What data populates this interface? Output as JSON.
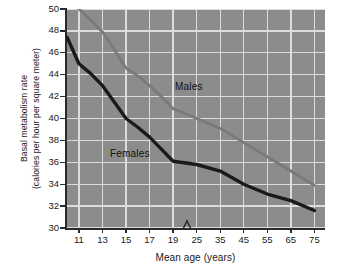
{
  "chart_data": {
    "type": "line",
    "title": "",
    "xlabel": "Mean age (years)",
    "ylabel_line1": "Basal metabolism rate",
    "ylabel_line2": "(calories per hour per square meter)",
    "x_tick_labels": [
      "11",
      "13",
      "15",
      "17",
      "19",
      "25",
      "35",
      "45",
      "55",
      "65",
      "75"
    ],
    "y_tick_labels": [
      "30",
      "32",
      "34",
      "36",
      "38",
      "40",
      "42",
      "44",
      "46",
      "48",
      "50"
    ],
    "ylim": [
      30,
      50
    ],
    "grid": true,
    "legend_position": "inline-annotation",
    "axis_break": {
      "between": [
        "19",
        "25"
      ],
      "symbol": "zigzag"
    },
    "plot_background": "#8c8c8c",
    "grid_color": "#dcdcdc",
    "series": [
      {
        "name": "Males",
        "color": "#7a7a7a",
        "label": "Males",
        "x": [
          "11",
          "12",
          "13",
          "14",
          "15",
          "16",
          "17",
          "18",
          "19",
          "25",
          "35",
          "45",
          "55",
          "65",
          "75"
        ],
        "values": [
          50.0,
          49.0,
          47.9,
          46.3,
          44.6,
          43.9,
          43.0,
          42.0,
          40.9,
          40.0,
          39.1,
          37.8,
          36.5,
          35.2,
          33.9
        ]
      },
      {
        "name": "Females",
        "color": "#1a1a1a",
        "label": "Females",
        "x": [
          "10",
          "11",
          "12",
          "13",
          "14",
          "15",
          "16",
          "17",
          "18",
          "19",
          "25",
          "35",
          "45",
          "55",
          "65",
          "75"
        ],
        "values": [
          47.4,
          45.0,
          44.1,
          43.0,
          41.5,
          40.0,
          39.2,
          38.3,
          37.2,
          36.1,
          35.8,
          35.2,
          34.0,
          33.1,
          32.5,
          31.6
        ]
      }
    ]
  }
}
